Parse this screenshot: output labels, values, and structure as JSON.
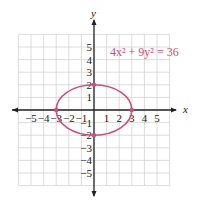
{
  "chart_data": {
    "type": "line",
    "title": "",
    "xlabel": "x",
    "ylabel": "y",
    "xlim": [
      -6,
      6
    ],
    "ylim": [
      -6,
      6
    ],
    "grid": true,
    "x_ticks": [
      -5,
      -4,
      -3,
      -2,
      -1,
      1,
      2,
      3,
      4,
      5
    ],
    "y_ticks": [
      -5,
      -4,
      -3,
      -2,
      -1,
      1,
      2,
      3,
      4,
      5
    ],
    "x_tick_labels": [
      "−5",
      "−4",
      "−3",
      "−2",
      "−1",
      "1",
      "2",
      "3",
      "4",
      "5"
    ],
    "y_tick_labels": [
      "−5",
      "−4",
      "−3",
      "−2",
      "−1",
      "1",
      "2",
      "3",
      "4",
      "5"
    ],
    "series": [
      {
        "name": "4x² + 9y² = 36",
        "shape": "ellipse",
        "center": [
          0,
          0
        ],
        "semi_major_x": 3,
        "semi_minor_y": 2,
        "color": "#d44a78"
      }
    ],
    "points": [
      {
        "x": -3,
        "y": 0
      },
      {
        "x": 3,
        "y": 0
      },
      {
        "x": 0,
        "y": 2
      },
      {
        "x": 0,
        "y": -2
      }
    ],
    "annotations": [
      {
        "text": "4x² + 9y² = 36",
        "position": "upper right",
        "color": "#d44a78"
      }
    ]
  },
  "labels": {
    "x_axis": "x",
    "y_axis": "y",
    "equation": "4x² + 9y² = 36"
  },
  "colors": {
    "curve": "#d44a78",
    "grid": "#cfcfcf",
    "axis": "#222222"
  }
}
